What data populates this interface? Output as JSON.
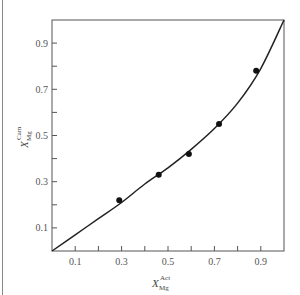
{
  "chart_data": {
    "type": "scatter",
    "title": "",
    "xlabel": "X_Mg^Act",
    "ylabel": "X_Mg^Cam",
    "xlabel_parts": {
      "base": "X",
      "sub": "Mg",
      "sup": "Act"
    },
    "ylabel_parts": {
      "base": "X",
      "sub": "Mg",
      "sup": "Cam"
    },
    "xlim": [
      0,
      1.0
    ],
    "ylim": [
      0,
      1.0
    ],
    "x_ticks": [
      0.1,
      0.2,
      0.3,
      0.4,
      0.5,
      0.6,
      0.7,
      0.8,
      0.9
    ],
    "x_tick_labels": [
      "0.1",
      "0.3",
      "0.5",
      "0.7",
      "0.9"
    ],
    "x_tick_label_values": [
      0.1,
      0.3,
      0.5,
      0.7,
      0.9
    ],
    "y_ticks": [
      0.1,
      0.2,
      0.3,
      0.4,
      0.5,
      0.6,
      0.7,
      0.8,
      0.9
    ],
    "y_tick_labels": [
      "0.1",
      "0.3",
      "0.5",
      "0.7",
      "0.9"
    ],
    "y_tick_label_values": [
      0.1,
      0.3,
      0.5,
      0.7,
      0.9
    ],
    "grid": false,
    "legend": null,
    "series": [
      {
        "name": "measured points",
        "kind": "scatter",
        "x": [
          0.29,
          0.46,
          0.59,
          0.72,
          0.88
        ],
        "y": [
          0.22,
          0.33,
          0.42,
          0.55,
          0.78
        ]
      },
      {
        "name": "fitted curve",
        "kind": "line",
        "x": [
          0.0,
          0.1,
          0.2,
          0.3,
          0.4,
          0.5,
          0.6,
          0.7,
          0.8,
          0.9,
          1.0
        ],
        "y": [
          0.0,
          0.07,
          0.14,
          0.21,
          0.29,
          0.36,
          0.44,
          0.53,
          0.64,
          0.79,
          1.0
        ]
      }
    ]
  },
  "colors": {
    "axis": "#555555",
    "curve": "#222222",
    "points": "#111111",
    "border": "#888888"
  }
}
